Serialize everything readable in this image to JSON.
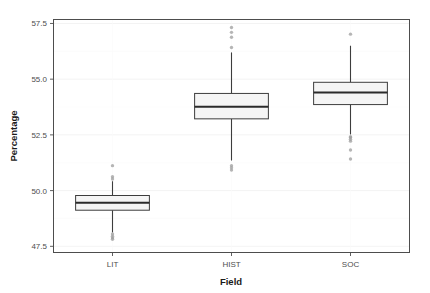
{
  "chart_data": {
    "type": "box",
    "title": "",
    "xlabel": "Field",
    "ylabel": "Percentage",
    "categories": [
      "LIT",
      "HIST",
      "SOC"
    ],
    "ylim": [
      47.2,
      57.7
    ],
    "yticks": [
      47.5,
      50.0,
      52.5,
      55.0,
      57.5
    ],
    "ytick_labels": [
      "47.5",
      "50.0",
      "52.5",
      "55.0",
      "57.5"
    ],
    "grid": true,
    "legend": "none",
    "box_color": "#f5f5f5",
    "line_color": "#3d3d3d",
    "outlier_color": "#9e9e9e",
    "boxes": [
      {
        "category": "LIT",
        "q1": 49.12,
        "median": 49.45,
        "q3": 49.78,
        "whisker_low": 48.12,
        "whisker_high": 50.42,
        "outliers": [
          51.12,
          50.62,
          50.52,
          48.05,
          47.95,
          47.88,
          47.82
        ]
      },
      {
        "category": "HIST",
        "q1": 53.22,
        "median": 53.76,
        "q3": 54.36,
        "whisker_low": 51.35,
        "whisker_high": 56.2,
        "outliers": [
          57.32,
          57.1,
          56.88,
          56.42,
          51.12,
          51.02,
          50.92
        ]
      },
      {
        "category": "SOC",
        "q1": 53.86,
        "median": 54.4,
        "q3": 54.86,
        "whisker_low": 52.52,
        "whisker_high": 56.5,
        "outliers": [
          57.02,
          52.42,
          52.38,
          52.3,
          52.22,
          51.82,
          51.42
        ]
      }
    ]
  }
}
